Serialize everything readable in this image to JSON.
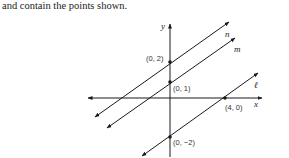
{
  "caption": "and contain the points shown.",
  "diagram": {
    "axes": {
      "x_label": "x",
      "y_label": "y"
    },
    "lines": [
      {
        "name": "n",
        "points": [
          "(0, 2)"
        ]
      },
      {
        "name": "m",
        "points": [
          "(0, 1)"
        ]
      },
      {
        "name": "ℓ",
        "points": [
          "(4, 0)",
          "(0, −2)"
        ]
      }
    ],
    "point_labels": {
      "p02": "(0, 2)",
      "p01": "(0, 1)",
      "p40": "(4, 0)",
      "p0m2": "(0, −2)"
    },
    "line_labels": {
      "n": "n",
      "m": "m",
      "l": "ℓ"
    },
    "colors": {
      "stroke": "#1a1a1a"
    }
  }
}
